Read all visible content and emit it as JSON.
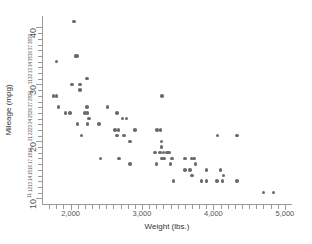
{
  "chart_data": {
    "type": "scatter",
    "title": "",
    "xlabel": "Weight (lbs.)",
    "ylabel": "Mileage (mpg)",
    "xlim": [
      1600,
      5100
    ],
    "ylim": [
      9,
      42
    ],
    "grid": false,
    "legend": null,
    "marker_color": "#6b6b6b",
    "axis_color": "#9a9a9a",
    "x_ticks_major": [
      2000,
      3000,
      4000,
      5000
    ],
    "x_tick_labels": [
      "2,000",
      "3,000",
      "4,000",
      "5,000"
    ],
    "x_ticks_minor": [
      1700,
      1800,
      1900,
      2100,
      2200,
      2300,
      2400,
      2500,
      2600,
      2700,
      2800,
      2900,
      3100,
      3200,
      3300,
      3400,
      3500,
      3600,
      3700,
      3800,
      3900,
      4100,
      4200,
      4300,
      4400,
      4500,
      4600,
      4700,
      4800,
      4900
    ],
    "y_ticks_major": [
      10,
      20,
      30,
      40
    ],
    "y_tick_labels_major": [
      "10",
      "20",
      "30",
      "40"
    ],
    "y_ticks_minor": [
      11,
      12,
      13,
      14,
      15,
      16,
      17,
      18,
      19,
      21,
      22,
      23,
      24,
      25,
      26,
      27,
      28,
      29,
      31,
      32,
      33,
      34,
      35,
      36,
      37,
      38,
      39
    ],
    "y_tick_labels_minor": [
      "11",
      "12",
      "13",
      "14",
      "15",
      "16",
      "17",
      "18",
      "19",
      "21",
      "22",
      "23",
      "24",
      "25",
      "26",
      "27",
      "28",
      "29",
      "31",
      "32",
      "33",
      "34",
      "35",
      "36",
      "37",
      "38",
      "39"
    ],
    "points": [
      {
        "x": 2050,
        "y": 41
      },
      {
        "x": 2070,
        "y": 35
      },
      {
        "x": 2090,
        "y": 35
      },
      {
        "x": 1800,
        "y": 34
      },
      {
        "x": 2230,
        "y": 31
      },
      {
        "x": 2020,
        "y": 30
      },
      {
        "x": 2130,
        "y": 30
      },
      {
        "x": 2130,
        "y": 29
      },
      {
        "x": 1760,
        "y": 28
      },
      {
        "x": 1800,
        "y": 28
      },
      {
        "x": 1830,
        "y": 26
      },
      {
        "x": 2230,
        "y": 26
      },
      {
        "x": 1930,
        "y": 25
      },
      {
        "x": 1990,
        "y": 25
      },
      {
        "x": 2200,
        "y": 25
      },
      {
        "x": 2240,
        "y": 25
      },
      {
        "x": 2520,
        "y": 26
      },
      {
        "x": 2650,
        "y": 25
      },
      {
        "x": 2730,
        "y": 24
      },
      {
        "x": 2780,
        "y": 24
      },
      {
        "x": 2260,
        "y": 24
      },
      {
        "x": 2100,
        "y": 23
      },
      {
        "x": 2240,
        "y": 23
      },
      {
        "x": 2400,
        "y": 23
      },
      {
        "x": 3280,
        "y": 28
      },
      {
        "x": 2620,
        "y": 22
      },
      {
        "x": 2670,
        "y": 22
      },
      {
        "x": 2900,
        "y": 22
      },
      {
        "x": 3210,
        "y": 22
      },
      {
        "x": 3260,
        "y": 22
      },
      {
        "x": 2650,
        "y": 21
      },
      {
        "x": 2750,
        "y": 21
      },
      {
        "x": 2150,
        "y": 21
      },
      {
        "x": 2830,
        "y": 20
      },
      {
        "x": 3270,
        "y": 20
      },
      {
        "x": 3270,
        "y": 19
      },
      {
        "x": 3180,
        "y": 18
      },
      {
        "x": 3250,
        "y": 18
      },
      {
        "x": 3300,
        "y": 18
      },
      {
        "x": 3350,
        "y": 18
      },
      {
        "x": 3380,
        "y": 18
      },
      {
        "x": 4060,
        "y": 21
      },
      {
        "x": 4330,
        "y": 21
      },
      {
        "x": 3280,
        "y": 17
      },
      {
        "x": 3310,
        "y": 17
      },
      {
        "x": 3420,
        "y": 17
      },
      {
        "x": 3600,
        "y": 17
      },
      {
        "x": 3690,
        "y": 17
      },
      {
        "x": 3730,
        "y": 17
      },
      {
        "x": 2420,
        "y": 17
      },
      {
        "x": 2680,
        "y": 17
      },
      {
        "x": 3200,
        "y": 16
      },
      {
        "x": 3400,
        "y": 16
      },
      {
        "x": 2830,
        "y": 16
      },
      {
        "x": 3750,
        "y": 16
      },
      {
        "x": 3600,
        "y": 15
      },
      {
        "x": 3670,
        "y": 15
      },
      {
        "x": 3900,
        "y": 15
      },
      {
        "x": 4100,
        "y": 15
      },
      {
        "x": 3700,
        "y": 14
      },
      {
        "x": 4140,
        "y": 14
      },
      {
        "x": 3440,
        "y": 13
      },
      {
        "x": 3830,
        "y": 13
      },
      {
        "x": 3900,
        "y": 13
      },
      {
        "x": 4050,
        "y": 13
      },
      {
        "x": 4130,
        "y": 13
      },
      {
        "x": 4330,
        "y": 13
      },
      {
        "x": 4700,
        "y": 11
      },
      {
        "x": 4840,
        "y": 11
      }
    ]
  }
}
